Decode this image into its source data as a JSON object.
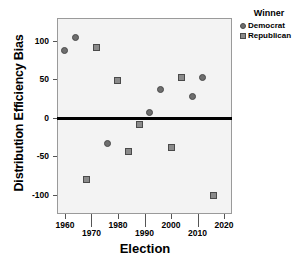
{
  "chart_data": {
    "type": "scatter",
    "title": "",
    "xlabel": "Election",
    "ylabel": "Distribution Efficiency Bias",
    "xlim": [
      1957,
      2023
    ],
    "ylim": [
      -125,
      130
    ],
    "grid": false,
    "legend_position": "right",
    "legend_title": "Winner",
    "reference_line": {
      "y": 0,
      "color": "#000000"
    },
    "xticks": [
      1960,
      1970,
      1980,
      1990,
      2000,
      2010,
      2020
    ],
    "xtick_labels": [
      "1960",
      "1970",
      "1980",
      "1990",
      "2000",
      "2010",
      "2020"
    ],
    "yticks": [
      100,
      50,
      0,
      -50,
      -100
    ],
    "ytick_labels": [
      "100",
      "50",
      "0",
      "-50",
      "-100"
    ],
    "series": [
      {
        "name": "Democrat",
        "marker": "circle",
        "color": "#6e6e6e",
        "points": [
          {
            "x": 1960,
            "y": 88
          },
          {
            "x": 1964,
            "y": 104
          },
          {
            "x": 1976,
            "y": -33
          },
          {
            "x": 1992,
            "y": 7
          },
          {
            "x": 1996,
            "y": 37
          },
          {
            "x": 2008,
            "y": 28
          },
          {
            "x": 2012,
            "y": 53
          }
        ]
      },
      {
        "name": "Republican",
        "marker": "square",
        "color": "#8a8a8a",
        "points": [
          {
            "x": 1968,
            "y": -80
          },
          {
            "x": 1972,
            "y": 91
          },
          {
            "x": 1980,
            "y": 49
          },
          {
            "x": 1984,
            "y": -44
          },
          {
            "x": 1988,
            "y": -9
          },
          {
            "x": 2000,
            "y": -38
          },
          {
            "x": 2004,
            "y": 53
          },
          {
            "x": 2016,
            "y": -101
          }
        ]
      }
    ]
  },
  "legend": {
    "title": "Winner",
    "entries": [
      {
        "label": "Democrat",
        "marker": "circle"
      },
      {
        "label": "Republican",
        "marker": "square"
      }
    ]
  },
  "axes": {
    "x_title": "Election",
    "y_title": "Distribution Efficiency Bias"
  }
}
